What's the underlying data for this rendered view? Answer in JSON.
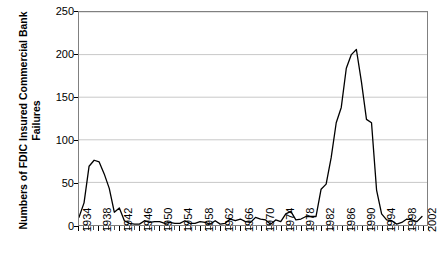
{
  "chart_data": {
    "type": "line",
    "title": "",
    "xlabel": "",
    "ylabel": "Numbers of FDIC Insured Commercial Bank Failures",
    "ylabel_line1": "Numbers of FDIC Insured Commercial Bank",
    "ylabel_line2": "Failures",
    "ylim": [
      0,
      250
    ],
    "xlim": [
      1934,
      2003
    ],
    "y_ticks": [
      0,
      50,
      100,
      150,
      200,
      250
    ],
    "y_tick_labels": [
      "0",
      "50",
      "100",
      "150",
      "200",
      "250"
    ],
    "x_tick_labels": [
      "1934",
      "1938",
      "1942",
      "1946",
      "1950",
      "1954",
      "1958",
      "1962",
      "1966",
      "1970",
      "1974",
      "1978",
      "1982",
      "1986",
      "1990",
      "1994",
      "1998",
      "2002"
    ],
    "x_tick_label_years": [
      1934,
      1938,
      1942,
      1946,
      1950,
      1954,
      1958,
      1962,
      1966,
      1970,
      1974,
      1978,
      1982,
      1986,
      1990,
      1994,
      1998,
      2002
    ],
    "x_minor_tick_step": 1,
    "grid": "horizontal",
    "legend": "none",
    "line_color": "#000000",
    "grid_color": "#c8c8c8",
    "axis_color": "#808080",
    "background_color": "#ffffff",
    "x": [
      1934,
      1935,
      1936,
      1937,
      1938,
      1939,
      1940,
      1941,
      1942,
      1943,
      1944,
      1945,
      1946,
      1947,
      1948,
      1949,
      1950,
      1951,
      1952,
      1953,
      1954,
      1955,
      1956,
      1957,
      1958,
      1959,
      1960,
      1961,
      1962,
      1963,
      1964,
      1965,
      1966,
      1967,
      1968,
      1969,
      1970,
      1971,
      1972,
      1973,
      1974,
      1975,
      1976,
      1977,
      1978,
      1979,
      1980,
      1981,
      1982,
      1983,
      1984,
      1985,
      1986,
      1987,
      1988,
      1989,
      1990,
      1991,
      1992,
      1993,
      1994,
      1995,
      1996,
      1997,
      1998,
      1999,
      2000,
      2001,
      2002
    ],
    "values": [
      9,
      26,
      69,
      76,
      74,
      60,
      43,
      15,
      20,
      5,
      2,
      1,
      1,
      5,
      3,
      4,
      4,
      2,
      3,
      2,
      2,
      5,
      2,
      2,
      4,
      3,
      1,
      5,
      1,
      2,
      7,
      5,
      7,
      4,
      3,
      9,
      7,
      6,
      1,
      6,
      4,
      13,
      16,
      6,
      7,
      10,
      10,
      10,
      42,
      48,
      79,
      120,
      138,
      184,
      200,
      206,
      168,
      124,
      120,
      41,
      13,
      6,
      5,
      1,
      3,
      7,
      6,
      4,
      10
    ],
    "series": [
      {
        "name": "FDIC Insured Commercial Bank Failures",
        "values": [
          9,
          26,
          69,
          76,
          74,
          60,
          43,
          15,
          20,
          5,
          2,
          1,
          1,
          5,
          3,
          4,
          4,
          2,
          3,
          2,
          2,
          5,
          2,
          2,
          4,
          3,
          1,
          5,
          1,
          2,
          7,
          5,
          7,
          4,
          3,
          9,
          7,
          6,
          1,
          6,
          4,
          13,
          16,
          6,
          7,
          10,
          10,
          10,
          42,
          48,
          79,
          120,
          138,
          184,
          200,
          206,
          168,
          124,
          120,
          41,
          13,
          6,
          5,
          1,
          3,
          7,
          6,
          4,
          10
        ]
      }
    ],
    "annotations": []
  }
}
